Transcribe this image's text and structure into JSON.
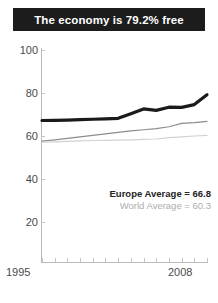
{
  "title": "The economy is 79.2% free",
  "legend": {
    "europe": "Europe Average = 66.8",
    "world": "World Average = 60.3"
  },
  "axis": {
    "x_start_label": "1995",
    "x_end_label": "2008",
    "y_labels": [
      "100",
      "80",
      "60",
      "40",
      "20"
    ]
  },
  "colors": {
    "banner_bg": "#1c1c1c",
    "banner_text": "#ffffff",
    "europe_line": "#1a1a1a",
    "mid_line": "#8c8c8c",
    "world_line": "#d2d2d2",
    "axis": "#b9b9b9",
    "tick_text": "#4a4a4a"
  },
  "chart_data": {
    "type": "line",
    "title": "The economy is 79.2% free",
    "xlabel": "",
    "ylabel": "",
    "xlim": [
      1995,
      2008
    ],
    "ylim": [
      0,
      100
    ],
    "grid": false,
    "legend_position": "inside-right",
    "x": [
      1995,
      1996,
      1997,
      1998,
      1999,
      2000,
      2001,
      2002,
      2003,
      2004,
      2005,
      2006,
      2007,
      2008
    ],
    "series": [
      {
        "name": "Country",
        "label": null,
        "color": "#1a1a1a",
        "width": 3.2,
        "values": [
          67.2,
          67.3,
          67.4,
          67.6,
          67.8,
          68.0,
          68.2,
          70.4,
          72.6,
          71.9,
          73.4,
          73.3,
          74.6,
          79.2
        ]
      },
      {
        "name": "Europe Average",
        "label": "Europe Average = 66.8",
        "color": "#8c8c8c",
        "width": 1.2,
        "values": [
          57.6,
          58.2,
          58.9,
          59.6,
          60.3,
          61.0,
          61.7,
          62.4,
          62.9,
          63.4,
          64.3,
          65.9,
          66.2,
          66.8
        ]
      },
      {
        "name": "World Average",
        "label": "World Average = 60.3",
        "color": "#d2d2d2",
        "width": 1.2,
        "values": [
          57.1,
          57.3,
          57.5,
          57.7,
          57.9,
          58.0,
          58.1,
          58.2,
          58.4,
          58.6,
          59.2,
          59.6,
          60.0,
          60.3
        ]
      }
    ]
  }
}
